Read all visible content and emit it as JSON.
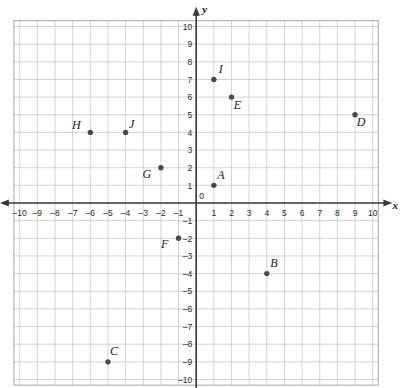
{
  "chart_data": {
    "type": "scatter",
    "title": "",
    "xlabel": "x",
    "ylabel": "y",
    "xlim": [
      -10,
      10
    ],
    "ylim": [
      -10,
      10
    ],
    "grid": true,
    "legend": "none",
    "x_ticks": [
      "-10",
      "-9",
      "-8",
      "-7",
      "-6",
      "-5",
      "-4",
      "-3",
      "-2",
      "-1",
      "1",
      "2",
      "3",
      "4",
      "5",
      "6",
      "7",
      "8",
      "9",
      "10"
    ],
    "y_ticks": [
      "10",
      "9",
      "8",
      "7",
      "6",
      "5",
      "4",
      "3",
      "2",
      "1",
      "-1",
      "-2",
      "-3",
      "-4",
      "-5",
      "-6",
      "-7",
      "-8",
      "-9",
      "-10"
    ],
    "origin_label": "0",
    "points": [
      {
        "label": "A",
        "x": 1,
        "y": 1,
        "label_dx": 7,
        "label_dy": -6
      },
      {
        "label": "B",
        "x": 4,
        "y": -4,
        "label_dx": 7,
        "label_dy": -7
      },
      {
        "label": "C",
        "x": -5,
        "y": -9,
        "label_dx": 6,
        "label_dy": -7
      },
      {
        "label": "D",
        "x": 9,
        "y": 5,
        "label_dx": 6,
        "label_dy": 11
      },
      {
        "label": "E",
        "x": 2,
        "y": 6,
        "label_dx": 6,
        "label_dy": 12
      },
      {
        "label": "F",
        "x": -1,
        "y": -2,
        "label_dx": -14,
        "label_dy": 10
      },
      {
        "label": "G",
        "x": -2,
        "y": 2,
        "label_dx": -14,
        "label_dy": 10
      },
      {
        "label": "H",
        "x": -6,
        "y": 4,
        "label_dx": -14,
        "label_dy": -3
      },
      {
        "label": "I",
        "x": 1,
        "y": 7,
        "label_dx": 7,
        "label_dy": -6
      },
      {
        "label": "J",
        "x": -4,
        "y": 4,
        "label_dx": 6,
        "label_dy": -4
      }
    ]
  }
}
